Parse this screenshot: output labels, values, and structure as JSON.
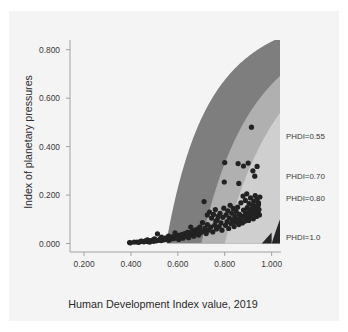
{
  "chart_data": {
    "type": "scatter",
    "title": "",
    "xlabel": "Human Development Index value, 2019",
    "ylabel": "Index of planetary pressures",
    "xlim": [
      0.14,
      1.04
    ],
    "ylim": [
      -0.035,
      0.84
    ],
    "xticks": [
      "0.200",
      "0.400",
      "0.600",
      "0.800",
      "1.000"
    ],
    "xtick_values": [
      0.2,
      0.4,
      0.6,
      0.8,
      1.0
    ],
    "yticks": [
      "0.000",
      "0.200",
      "0.400",
      "0.600",
      "0.800"
    ],
    "ytick_values": [
      0.0,
      0.2,
      0.4,
      0.6,
      0.8
    ],
    "grid": false,
    "legend_position": "right-edge-annotations",
    "annotations": [
      {
        "label": "PHDI=0.55",
        "x": 1.0,
        "y": 0.44
      },
      {
        "label": "PHDI=0.70",
        "x": 1.0,
        "y": 0.275
      },
      {
        "label": "PHDI=0.80",
        "x": 1.0,
        "y": 0.185
      },
      {
        "label": "PHDI=1.0",
        "x": 1.0,
        "y": 0.022
      }
    ],
    "bands": [
      {
        "name": "phdi-0.55-band",
        "phdi": 0.55,
        "color": "#7e7e7e"
      },
      {
        "name": "phdi-0.70-band",
        "phdi": 0.7,
        "color": "#b0b0b0"
      },
      {
        "name": "phdi-0.80-band",
        "phdi": 0.8,
        "color": "#cfcfcf"
      },
      {
        "name": "phdi-1.0-band",
        "phdi": 1.0,
        "color": "#262626"
      }
    ],
    "point_color": "#222222",
    "point_radius": 2.6,
    "points": [
      [
        0.394,
        0.004
      ],
      [
        0.398,
        0.003
      ],
      [
        0.427,
        0.006
      ],
      [
        0.434,
        0.005
      ],
      [
        0.447,
        0.009
      ],
      [
        0.455,
        0.007
      ],
      [
        0.462,
        0.011
      ],
      [
        0.47,
        0.008
      ],
      [
        0.477,
        0.012
      ],
      [
        0.48,
        0.006
      ],
      [
        0.485,
        0.01
      ],
      [
        0.492,
        0.014
      ],
      [
        0.497,
        0.009
      ],
      [
        0.503,
        0.016
      ],
      [
        0.508,
        0.011
      ],
      [
        0.513,
        0.04
      ],
      [
        0.518,
        0.013
      ],
      [
        0.524,
        0.018
      ],
      [
        0.529,
        0.012
      ],
      [
        0.534,
        0.02
      ],
      [
        0.54,
        0.015
      ],
      [
        0.545,
        0.022
      ],
      [
        0.55,
        0.017
      ],
      [
        0.556,
        0.024
      ],
      [
        0.561,
        0.013
      ],
      [
        0.566,
        0.026
      ],
      [
        0.571,
        0.019
      ],
      [
        0.577,
        0.028
      ],
      [
        0.582,
        0.021
      ],
      [
        0.588,
        0.03
      ],
      [
        0.593,
        0.023
      ],
      [
        0.598,
        0.033
      ],
      [
        0.604,
        0.017
      ],
      [
        0.609,
        0.035
      ],
      [
        0.614,
        0.026
      ],
      [
        0.62,
        0.038
      ],
      [
        0.625,
        0.029
      ],
      [
        0.63,
        0.041
      ],
      [
        0.636,
        0.032
      ],
      [
        0.641,
        0.046
      ],
      [
        0.646,
        0.024
      ],
      [
        0.652,
        0.044
      ],
      [
        0.657,
        0.036
      ],
      [
        0.662,
        0.05
      ],
      [
        0.668,
        0.03
      ],
      [
        0.673,
        0.055
      ],
      [
        0.678,
        0.042
      ],
      [
        0.684,
        0.06
      ],
      [
        0.689,
        0.035
      ],
      [
        0.694,
        0.068
      ],
      [
        0.7,
        0.046
      ],
      [
        0.705,
        0.086
      ],
      [
        0.71,
        0.052
      ],
      [
        0.712,
        0.173
      ],
      [
        0.716,
        0.063
      ],
      [
        0.721,
        0.041
      ],
      [
        0.726,
        0.078
      ],
      [
        0.731,
        0.055
      ],
      [
        0.735,
        0.13
      ],
      [
        0.74,
        0.068
      ],
      [
        0.744,
        0.105
      ],
      [
        0.749,
        0.048
      ],
      [
        0.752,
        0.12
      ],
      [
        0.757,
        0.075
      ],
      [
        0.76,
        0.14
      ],
      [
        0.765,
        0.06
      ],
      [
        0.768,
        0.098
      ],
      [
        0.772,
        0.112
      ],
      [
        0.776,
        0.07
      ],
      [
        0.78,
        0.125
      ],
      [
        0.784,
        0.085
      ],
      [
        0.788,
        0.055
      ],
      [
        0.792,
        0.108
      ],
      [
        0.796,
        0.146
      ],
      [
        0.798,
        0.254
      ],
      [
        0.8,
        0.334
      ],
      [
        0.803,
        0.075
      ],
      [
        0.806,
        0.118
      ],
      [
        0.81,
        0.09
      ],
      [
        0.813,
        0.135
      ],
      [
        0.817,
        0.062
      ],
      [
        0.82,
        0.105
      ],
      [
        0.823,
        0.158
      ],
      [
        0.827,
        0.082
      ],
      [
        0.83,
        0.125
      ],
      [
        0.833,
        0.098
      ],
      [
        0.836,
        0.145
      ],
      [
        0.84,
        0.07
      ],
      [
        0.843,
        0.112
      ],
      [
        0.846,
        0.088
      ],
      [
        0.849,
        0.132
      ],
      [
        0.852,
        0.102
      ],
      [
        0.855,
        0.15
      ],
      [
        0.857,
        0.33
      ],
      [
        0.86,
        0.078
      ],
      [
        0.863,
        0.12
      ],
      [
        0.866,
        0.095
      ],
      [
        0.869,
        0.168
      ],
      [
        0.872,
        0.108
      ],
      [
        0.875,
        0.085
      ],
      [
        0.878,
        0.196
      ],
      [
        0.88,
        0.138
      ],
      [
        0.883,
        0.115
      ],
      [
        0.885,
        0.092
      ],
      [
        0.888,
        0.178
      ],
      [
        0.89,
        0.128
      ],
      [
        0.892,
        0.105
      ],
      [
        0.894,
        0.205
      ],
      [
        0.896,
        0.148
      ],
      [
        0.898,
        0.118
      ],
      [
        0.9,
        0.332
      ],
      [
        0.902,
        0.095
      ],
      [
        0.904,
        0.165
      ],
      [
        0.906,
        0.132
      ],
      [
        0.908,
        0.11
      ],
      [
        0.91,
        0.188
      ],
      [
        0.912,
        0.142
      ],
      [
        0.914,
        0.48
      ],
      [
        0.916,
        0.12
      ],
      [
        0.918,
        0.16
      ],
      [
        0.92,
        0.135
      ],
      [
        0.922,
        0.102
      ],
      [
        0.924,
        0.175
      ],
      [
        0.926,
        0.145
      ],
      [
        0.928,
        0.125
      ],
      [
        0.93,
        0.198
      ],
      [
        0.932,
        0.155
      ],
      [
        0.934,
        0.13
      ],
      [
        0.936,
        0.112
      ],
      [
        0.938,
        0.182
      ],
      [
        0.94,
        0.15
      ],
      [
        0.942,
        0.128
      ],
      [
        0.944,
        0.168
      ],
      [
        0.946,
        0.14
      ],
      [
        0.948,
        0.118
      ],
      [
        0.95,
        0.192
      ],
      [
        0.938,
        0.318
      ],
      [
        0.928,
        0.278
      ],
      [
        0.92,
        0.3
      ],
      [
        0.944,
        0.16
      ],
      [
        0.86,
        0.248
      ],
      [
        0.88,
        0.32
      ],
      [
        0.762,
        0.092
      ],
      [
        0.726,
        0.118
      ],
      [
        0.69,
        0.052
      ],
      [
        0.655,
        0.068
      ],
      [
        0.622,
        0.022
      ],
      [
        0.588,
        0.044
      ],
      [
        0.56,
        0.031
      ],
      [
        0.53,
        0.026
      ],
      [
        0.5,
        0.019
      ],
      [
        0.47,
        0.015
      ],
      [
        0.443,
        0.01
      ],
      [
        0.414,
        0.006
      ]
    ]
  }
}
